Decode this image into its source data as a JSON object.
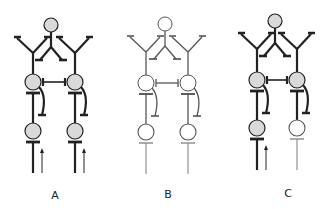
{
  "figure": {
    "panels": [
      {
        "label": "A",
        "x_offset": 0,
        "cx_left": 33,
        "cx_mid": 51,
        "cx_right": 75,
        "top_y": 25,
        "mid_y": 82,
        "bot_y": 131,
        "stroke": "#222222",
        "stroke_width": 2.2,
        "thin_stroke": "#222222",
        "fills": {
          "top": "#d9d9d9",
          "mid_left": "#d9d9d9",
          "mid_right": "#d9d9d9",
          "bot_left": "#d9d9d9",
          "bot_right": "#d9d9d9"
        },
        "bottom_style": {
          "left": "bold",
          "right": "bold"
        },
        "arrows": {
          "left": true,
          "right": true
        }
      },
      {
        "label": "B",
        "x_offset": 0,
        "cx_left": 146,
        "cx_mid": 165,
        "cx_right": 188,
        "top_y": 24,
        "mid_y": 83,
        "bot_y": 132,
        "stroke": "#555555",
        "stroke_width": 1.3,
        "thin_stroke": "#888888",
        "fills": {
          "top": "#ffffff",
          "mid_left": "#ffffff",
          "mid_right": "#ffffff",
          "bot_left": "#ffffff",
          "bot_right": "#ffffff"
        },
        "bottom_style": {
          "left": "thin",
          "right": "thin"
        },
        "arrows": {
          "left": false,
          "right": false
        }
      },
      {
        "label": "C",
        "x_offset": 0,
        "cx_left": 257,
        "cx_mid": 275,
        "cx_right": 297,
        "top_y": 21,
        "mid_y": 80,
        "bot_y": 128,
        "stroke": "#222222",
        "stroke_width": 2.2,
        "thin_stroke": "#888888",
        "fills": {
          "top": "#d9d9d9",
          "mid_left": "#d9d9d9",
          "mid_right": "#d9d9d9",
          "bot_left": "#d9d9d9",
          "bot_right": "#ffffff"
        },
        "bottom_style": {
          "left": "bold",
          "right": "thin"
        },
        "arrows": {
          "left": true,
          "right": false
        }
      }
    ],
    "labels": [
      {
        "text": "A",
        "x": 55,
        "y": 189
      },
      {
        "text": "B",
        "x": 168,
        "y": 188
      },
      {
        "text": "C",
        "x": 288,
        "y": 187
      }
    ]
  }
}
